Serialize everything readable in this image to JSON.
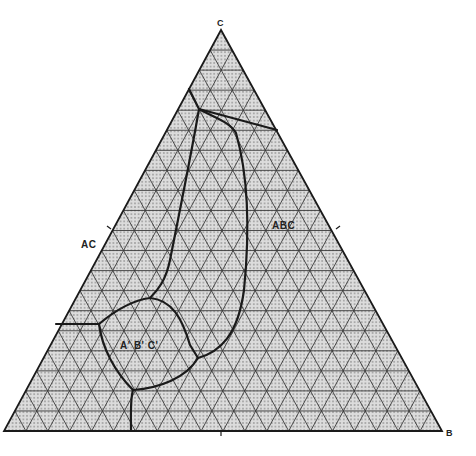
{
  "diagram": {
    "type": "ternary-phase-diagram",
    "grid_divisions": 20,
    "colors": {
      "background": "#ffffff",
      "fill": "#d9d9d9",
      "dots": "#6a6a6a",
      "grid": "#3a3a3a",
      "boundary": "#1a1a1a"
    },
    "vertices": {
      "C": {
        "label": "C",
        "x": 221,
        "y": 30
      },
      "A": {
        "label": "",
        "x": 4,
        "y": 431
      },
      "B": {
        "label": "B",
        "x": 442,
        "y": 431
      }
    },
    "labels": [
      {
        "id": "vertex-c",
        "text": "C",
        "x": 217,
        "y": 19,
        "kind": "vertex"
      },
      {
        "id": "vertex-b",
        "text": "B",
        "x": 446,
        "y": 429,
        "kind": "vertex"
      },
      {
        "id": "edge-ac",
        "text": "AC",
        "x": 81,
        "y": 240,
        "kind": "region"
      },
      {
        "id": "region-abc",
        "text": "ABC",
        "x": 272,
        "y": 221,
        "kind": "region"
      },
      {
        "id": "region-a-b-c-prime",
        "text": "A' B' C'",
        "x": 120,
        "y": 341,
        "kind": "region"
      }
    ],
    "tick_marks": [
      {
        "x1": 107,
        "y1": 226,
        "x2": 111,
        "y2": 229
      },
      {
        "x1": 336,
        "y1": 229,
        "x2": 340,
        "y2": 226
      },
      {
        "x1": 221,
        "y1": 431,
        "x2": 221,
        "y2": 436
      }
    ],
    "boundaries": [
      {
        "id": "top-horizontal",
        "d": "M199,109 L277,130"
      },
      {
        "id": "top-left-segment",
        "d": "M189,89 L199,109"
      },
      {
        "id": "abc-left-curve",
        "d": "M199,109 C192,150 176,230 170,260 C166,280 158,290 150,298"
      },
      {
        "id": "abc-right-curve",
        "d": "M199,109 C215,118 230,122 236,133 C248,175 250,230 244,290 C238,335 220,352 198,358"
      },
      {
        "id": "aprime-loop-top",
        "d": "M99,324 C118,308 135,300 150,298 C172,300 182,318 190,345 L198,358"
      },
      {
        "id": "aprime-loop-bottom",
        "d": "M99,324 C102,348 115,372 133,390 C160,388 186,378 198,358"
      },
      {
        "id": "left-horizontal",
        "d": "M56,324 L99,324"
      },
      {
        "id": "bottom-vertical",
        "d": "M133,390 C130,400 131,418 131,431"
      }
    ]
  }
}
